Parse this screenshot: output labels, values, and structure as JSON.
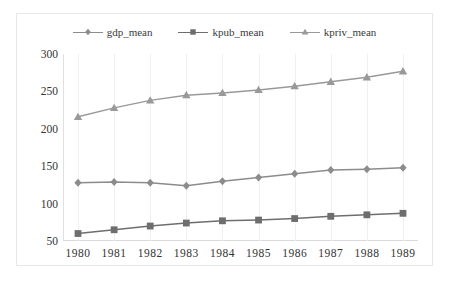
{
  "chart_data": {
    "type": "line",
    "title": "",
    "xlabel": "",
    "ylabel": "",
    "x": [
      1980,
      1981,
      1982,
      1983,
      1984,
      1985,
      1986,
      1987,
      1988,
      1989
    ],
    "categories": [
      "1980",
      "1981",
      "1982",
      "1983",
      "1984",
      "1985",
      "1986",
      "1987",
      "1988",
      "1989"
    ],
    "series": [
      {
        "name": "gdp_mean",
        "marker": "diamond",
        "color": "#8c8c8c",
        "values": [
          128,
          129,
          128,
          124,
          130,
          135,
          140,
          145,
          146,
          148
        ]
      },
      {
        "name": "kpub_mean",
        "marker": "square",
        "color": "#6e6e6e",
        "values": [
          60,
          65,
          70,
          74,
          77,
          78,
          80,
          83,
          85,
          87
        ]
      },
      {
        "name": "kpriv_mean",
        "marker": "triangle",
        "color": "#999999",
        "values": [
          216,
          228,
          238,
          245,
          248,
          252,
          257,
          263,
          269,
          277
        ]
      }
    ],
    "ylim": [
      50,
      300
    ],
    "yticks": [
      300,
      250,
      200,
      150,
      100,
      50
    ],
    "ytick_labels": [
      "300",
      "250",
      "200",
      "150",
      "100",
      "50"
    ],
    "xlim": [
      1980,
      1989
    ],
    "grid": "vertical",
    "legend_position": "top-center",
    "legend": [
      {
        "label": "gdp_mean",
        "marker": "diamond",
        "color": "#8c8c8c"
      },
      {
        "label": "kpub_mean",
        "marker": "square",
        "color": "#6e6e6e"
      },
      {
        "label": "kpriv_mean",
        "marker": "triangle",
        "color": "#999999"
      }
    ],
    "plot_background": "#ffffff",
    "grid_color": "#f0f0f0",
    "axis_color": "#d9d9d9",
    "text_color": "#333333"
  }
}
